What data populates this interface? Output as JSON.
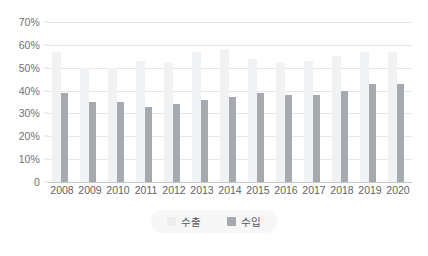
{
  "chart_data": {
    "type": "bar",
    "title": "",
    "subtitle": "",
    "xlabel": "",
    "ylabel": "",
    "grid": true,
    "legend_position": "bottom",
    "ylim": [
      0,
      70
    ],
    "ytick_labels": [
      "0",
      "10%",
      "20%",
      "30%",
      "40%",
      "50%",
      "60%",
      "70%"
    ],
    "ytick_values": [
      0,
      10,
      20,
      30,
      40,
      50,
      60,
      70
    ],
    "categories": [
      "2008",
      "2009",
      "2010",
      "2011",
      "2012",
      "2013",
      "2014",
      "2015",
      "2016",
      "2017",
      "2018",
      "2019",
      "2020"
    ],
    "series": [
      {
        "name": "수출",
        "color": "#f1f2f3",
        "values": [
          57,
          50,
          50,
          53,
          52,
          57,
          58,
          54,
          52,
          53,
          55,
          57,
          57
        ]
      },
      {
        "name": "수입",
        "color": "#a6a9ad",
        "values": [
          39,
          35,
          35,
          33,
          34,
          36,
          37,
          39,
          38,
          38,
          40,
          43,
          43
        ]
      }
    ]
  },
  "legend": {
    "items": [
      {
        "label": "수출",
        "swatch_class": "export"
      },
      {
        "label": "수입",
        "swatch_class": "import"
      }
    ]
  },
  "colors": {
    "background": "#ffffff",
    "gridline": "#e4e6e8",
    "axis": "#c3c6ca",
    "tick_text": "#6f7276",
    "export_bar": "#f1f2f3",
    "import_bar": "#a6a9ad",
    "legend_background": "#f7f7f8"
  }
}
